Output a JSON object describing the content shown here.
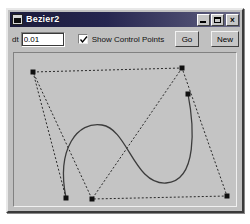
{
  "window": {
    "title": "Bezier2",
    "icon": "app-window-icon",
    "controls": {
      "minimize": "_",
      "maximize": "□",
      "close": "×"
    }
  },
  "toolbar": {
    "dt_label": "dt",
    "dt_value": "0.01",
    "dt_placeholder": "0.01",
    "show_control_points_label": "Show Control Points",
    "show_control_points_checked": true,
    "go_label": "Go",
    "new_label": "New"
  },
  "canvas": {
    "background": "#c4c4c4",
    "curve_color": "#3c3c3c",
    "hull_color": "#2a2a2a",
    "point_color": "#101010",
    "control_points": [
      {
        "id": "p0",
        "x": 19,
        "y": 19
      },
      {
        "id": "p1",
        "x": 168,
        "y": 15
      },
      {
        "id": "p2",
        "x": 174,
        "y": 41
      },
      {
        "id": "p3",
        "x": 213,
        "y": 143
      },
      {
        "id": "p4",
        "x": 78,
        "y": 146
      },
      {
        "id": "p5",
        "x": 52,
        "y": 145
      }
    ],
    "hull_path": "M19,19 L168,15 L213,143 L78,146 Z",
    "hull_extra_path": "M19,19 L52,145 M168,15 L78,146",
    "curve_path": "M52,145 C42,95 64,68 88,72 C114,76 120,132 152,130 C184,128 180,72 174,41"
  }
}
